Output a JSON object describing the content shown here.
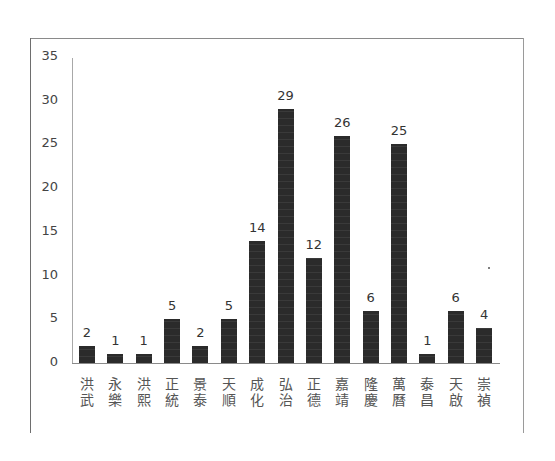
{
  "chart_data": {
    "type": "bar",
    "title": "",
    "xlabel": "",
    "ylabel": "",
    "ylim": [
      0,
      35
    ],
    "yticks": [
      0,
      5,
      10,
      15,
      20,
      25,
      30,
      35
    ],
    "grid": false,
    "legend": null,
    "data_labels": true,
    "bar_color": "#2b2b2b",
    "categories": [
      "洪武",
      "永樂",
      "洪熙",
      "正統",
      "景泰",
      "天順",
      "成化",
      "弘治",
      "正德",
      "嘉靖",
      "隆慶",
      "萬曆",
      "泰昌",
      "天啟",
      "崇禎"
    ],
    "values": [
      2,
      1,
      1,
      5,
      2,
      5,
      14,
      29,
      12,
      26,
      6,
      25,
      1,
      6,
      4
    ]
  },
  "ytick_labels": [
    "0",
    "5",
    "10",
    "15",
    "20",
    "25",
    "30",
    "35"
  ],
  "value_labels": [
    "2",
    "1",
    "1",
    "5",
    "2",
    "5",
    "14",
    "29",
    "12",
    "26",
    "6",
    "25",
    "1",
    "6",
    "4"
  ],
  "category_labels": [
    {
      "top": "洪",
      "bottom": "武"
    },
    {
      "top": "永",
      "bottom": "樂"
    },
    {
      "top": "洪",
      "bottom": "熙"
    },
    {
      "top": "正",
      "bottom": "統"
    },
    {
      "top": "景",
      "bottom": "泰"
    },
    {
      "top": "天",
      "bottom": "順"
    },
    {
      "top": "成",
      "bottom": "化"
    },
    {
      "top": "弘",
      "bottom": "治"
    },
    {
      "top": "正",
      "bottom": "德"
    },
    {
      "top": "嘉",
      "bottom": "靖"
    },
    {
      "top": "隆",
      "bottom": "慶"
    },
    {
      "top": "萬",
      "bottom": "曆"
    },
    {
      "top": "泰",
      "bottom": "昌"
    },
    {
      "top": "天",
      "bottom": "啟"
    },
    {
      "top": "崇",
      "bottom": "禎"
    }
  ]
}
